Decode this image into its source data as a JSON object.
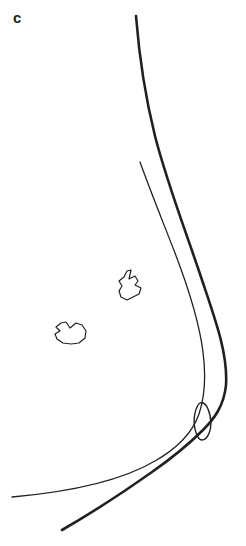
{
  "figure": {
    "panel_label": "c",
    "kind": "line-drawing",
    "background_color": "#ffffff",
    "ink_color": "#231f20",
    "canvas": {
      "width": 246,
      "height": 546
    }
  },
  "strokes": {
    "outer_contour": {
      "name": "outer-breast-contour",
      "width": 2.6,
      "start": [
        136,
        16
      ],
      "end": [
        62,
        530
      ],
      "max_x": 229
    },
    "inner_contour": {
      "name": "inner-breast-contour",
      "width": 1.3,
      "start": [
        140,
        162
      ],
      "end": [
        12,
        497
      ]
    },
    "nipple": {
      "name": "nipple-lens",
      "width": 1.4,
      "bounds": [
        196,
        404,
        16,
        34
      ]
    }
  },
  "lesions": [
    {
      "name": "lesion-upper",
      "width": 1.2,
      "bounds": [
        118,
        269,
        25,
        32
      ],
      "shape": "irregular-teardrop"
    },
    {
      "name": "lesion-lower",
      "width": 1.2,
      "bounds": [
        55,
        321,
        32,
        24
      ],
      "shape": "irregular-lobulated"
    }
  ]
}
